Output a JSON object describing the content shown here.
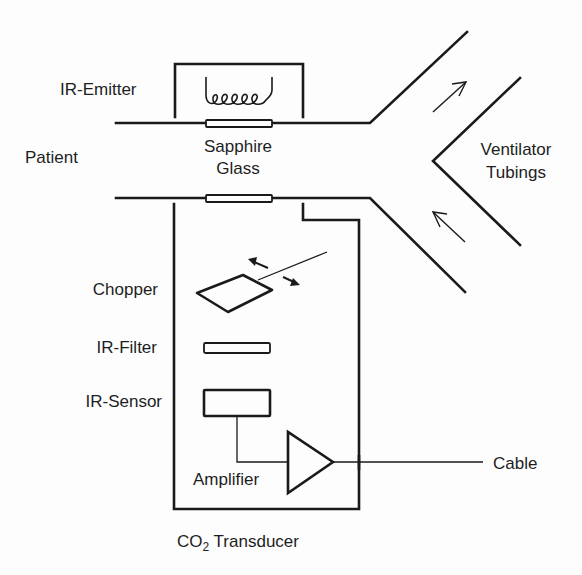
{
  "diagram": {
    "title": "CO2 Transducer",
    "labels": {
      "ir_emitter": "IR-Emitter",
      "patient": "Patient",
      "sapphire_line1": "Sapphire",
      "sapphire_line2": "Glass",
      "ventilator_line1": "Ventilator",
      "ventilator_line2": "Tubings",
      "chopper": "Chopper",
      "ir_filter": "IR-Filter",
      "ir_sensor": "IR-Sensor",
      "amplifier": "Amplifier",
      "cable": "Cable",
      "transducer_prefix": "CO",
      "transducer_sub": "2",
      "transducer_suffix": " Transducer"
    },
    "components": [
      "IR-Emitter (heating coil)",
      "Sapphire Glass windows",
      "Chopper",
      "IR-Filter",
      "IR-Sensor",
      "Amplifier",
      "Cable"
    ],
    "flow": {
      "left_end": "Patient",
      "right_end": "Ventilator Tubings",
      "upper_branch_arrow": "outgoing",
      "lower_branch_arrow": "incoming"
    },
    "colors": {
      "line": "#1a1a1a",
      "text": "#1e1e1e",
      "background": "#fdfdfd"
    }
  }
}
